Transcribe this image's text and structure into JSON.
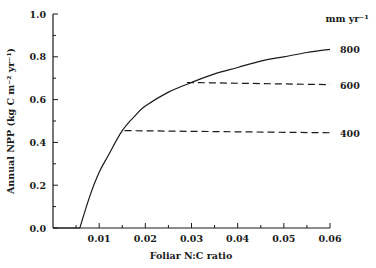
{
  "chart_data": {
    "type": "line",
    "title": "",
    "xlabel": "Foliar N:C ratio",
    "ylabel": "Annual NPP (kg C m⁻² yr⁻¹)",
    "xlim": [
      0,
      0.06
    ],
    "ylim": [
      0,
      1.0
    ],
    "x_ticks": [
      "0.01",
      "0.02",
      "0.03",
      "0.04",
      "0.05",
      "0.06"
    ],
    "x_tick_values": [
      0.01,
      0.02,
      0.03,
      0.04,
      0.05,
      0.06
    ],
    "y_ticks": [
      "0.0",
      "0.2",
      "0.4",
      "0.6",
      "0.8",
      "1.0"
    ],
    "y_tick_values": [
      0.0,
      0.2,
      0.4,
      0.6,
      0.8,
      1.0
    ],
    "grid": false,
    "legend_title": "mm yr⁻¹",
    "legend_position": "right",
    "series": [
      {
        "name": "800",
        "style": "solid",
        "x": [
          0.0,
          0.0058,
          0.008,
          0.01,
          0.012,
          0.015,
          0.018,
          0.02,
          0.025,
          0.03,
          0.035,
          0.04,
          0.045,
          0.05,
          0.055,
          0.06
        ],
        "y": [
          0.0,
          0.0,
          0.15,
          0.26,
          0.34,
          0.455,
          0.53,
          0.57,
          0.635,
          0.68,
          0.72,
          0.75,
          0.78,
          0.8,
          0.82,
          0.835
        ]
      },
      {
        "name": "600",
        "style": "dashed",
        "x": [
          0.029,
          0.06
        ],
        "y": [
          0.68,
          0.67
        ]
      },
      {
        "name": "400",
        "style": "dashed",
        "x": [
          0.0155,
          0.06
        ],
        "y": [
          0.455,
          0.445
        ]
      }
    ]
  }
}
